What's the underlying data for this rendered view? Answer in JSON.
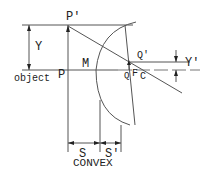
{
  "diagram": {
    "title": "CONVEX",
    "labels": {
      "p_prime": "P'",
      "y": "Y",
      "object": "object",
      "p": "P",
      "m": "M",
      "q_prime": "Q'",
      "q": "Q",
      "f": "F",
      "c": "C",
      "y_prime": "Y'",
      "s_left": "S",
      "s_right": "S'"
    },
    "colors": {
      "stroke": "#555555",
      "text": "#222222",
      "background": "#ffffff"
    }
  }
}
